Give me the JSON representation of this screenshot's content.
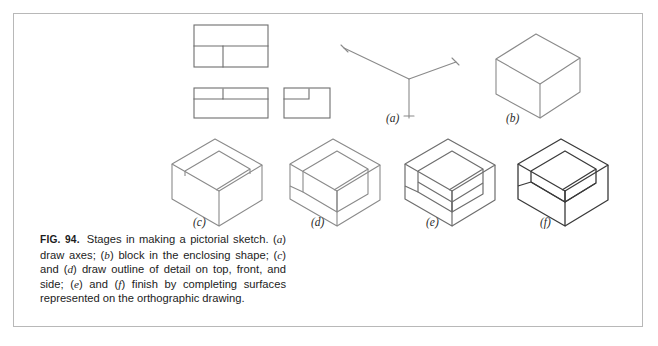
{
  "figure": {
    "number_label": "FIG. 94.",
    "caption_text": "Stages in making a pictorial sketch. (a) draw axes; (b) block in the enclosing shape; (c) and (d) draw outline of detail on top, front, and side; (e) and (f) finish by completing surfaces represented on the orthographic drawing.",
    "caption_parts": {
      "s1": "Stages in making a pictorial sketch. ",
      "a": "a",
      "s2": ") draw axes; (",
      "b": "b",
      "s3": ") block in the enclosing shape; (",
      "c": "c",
      "s4": ") and (",
      "d": "d",
      "s5": ") draw outline of detail on top, front, and side; (",
      "e": "e",
      "s6": ") and (",
      "f": "f",
      "s7": ") finish by completing surfaces represented on the orthographic drawing.",
      "open_paren": "("
    }
  },
  "subfigures": [
    {
      "key": "a",
      "label": "(a)",
      "title": "draw axes"
    },
    {
      "key": "b",
      "label": "(b)",
      "title": "block in the enclosing shape"
    },
    {
      "key": "c",
      "label": "(c)",
      "title": "draw outline of detail on top"
    },
    {
      "key": "d",
      "label": "(d)",
      "title": "draw outline of detail on front and side"
    },
    {
      "key": "e",
      "label": "(e)",
      "title": "completing surfaces"
    },
    {
      "key": "f",
      "label": "(f)",
      "title": "finished pictorial sketch"
    }
  ],
  "orthographic_views": [
    {
      "name": "top-view",
      "description": "top view rectangle with notch outline"
    },
    {
      "name": "front-view",
      "description": "front view rectangle with notch outline"
    },
    {
      "name": "side-view",
      "description": "side view rectangle with notch outline"
    }
  ],
  "colors": {
    "border": "#b8b8b8",
    "line_light": "#8a8a8a",
    "line_medium": "#6e6e6e",
    "line_dark": "#3a3a3a",
    "background": "#ffffff",
    "text": "#1c1c1c"
  }
}
